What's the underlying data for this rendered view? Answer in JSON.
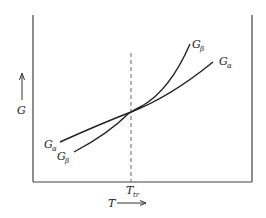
{
  "diagram": {
    "title": "",
    "axes": {
      "x_label": "T",
      "y_label": "G",
      "x_arrow": "right-arrow",
      "y_arrow": "up-arrow"
    },
    "marker": {
      "label_main": "T",
      "label_sub": "tr",
      "style": "dashed-vertical-line"
    },
    "curves": [
      {
        "name": "G_alpha",
        "label_main": "G",
        "label_sub": "α",
        "description": "shallower slope curve"
      },
      {
        "name": "G_beta",
        "label_main": "G",
        "label_sub": "β",
        "description": "steeper slope curve"
      }
    ],
    "colors": {
      "line": "#222222",
      "frame": "#444444",
      "dash": "#666666"
    }
  }
}
